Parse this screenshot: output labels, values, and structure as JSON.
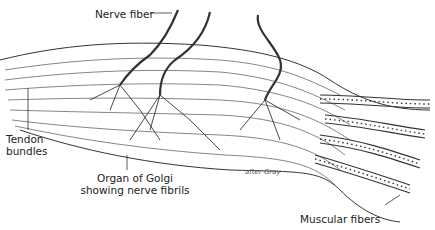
{
  "diagram": {
    "labels": {
      "nerve_fiber": "Nerve fiber",
      "tendon_bundles_line1": "Tendon",
      "tendon_bundles_line2": "bundles",
      "organ_line1": "Organ of Golgi",
      "organ_line2": "showing nerve fibrils",
      "muscular_fibers": "Muscular fibers",
      "credit": "after Gray"
    },
    "colors": {
      "ink": "#222222",
      "background": "#ffffff"
    }
  }
}
